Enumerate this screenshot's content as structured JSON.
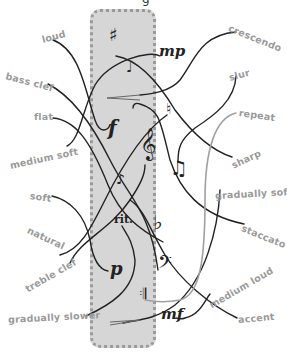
{
  "title_fragment": "g",
  "terms": {
    "loud": "loud",
    "bass_clef": "bass clef",
    "flat": "flat",
    "medium_soft": "medium soft",
    "soft": "soft",
    "natural": "natural",
    "treble_clef": "treble clef",
    "gradually_slower": "gradually slower",
    "crescendo": "crescendo",
    "slur": "slur",
    "repeat": "repeat",
    "sharp": "sharp",
    "gradually_softer": "gradually softer",
    "staccato": "staccato",
    "medium_loud": "medium loud",
    "accent": "accent"
  },
  "symbols": {
    "sharp": "♯",
    "mp": "mp",
    "staccato_note": "♩",
    "natural": "♮",
    "f": "f",
    "treble_clef": "𝄞",
    "eighth_notes": "♫",
    "accent_note": "♪",
    "rit": "rit.",
    "flat": "♭",
    "bass_clef": "𝄢",
    "p": "p",
    "repeat": "𝄇",
    "mf": "mf"
  },
  "colors": {
    "panel": "#d6d6d6",
    "panel_border": "#9a9a9a",
    "label_text": "#9a9a9a",
    "line": "#222222",
    "line_gray": "#a0a0a0"
  }
}
